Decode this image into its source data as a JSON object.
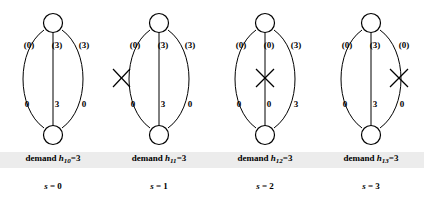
{
  "figure": {
    "type": "diagram",
    "panels": [
      {
        "id": "panel-s0",
        "demand_label": "demand",
        "demand_var": "h",
        "demand_sub": "10",
        "demand_eq": "=3",
        "state_var": "s",
        "state_eq": "= 0",
        "links": [
          {
            "name": "left-arc",
            "capacity_label": "(0)",
            "flow_label": "0",
            "failed": false
          },
          {
            "name": "middle-link",
            "capacity_label": "(3)",
            "flow_label": "3",
            "failed": false
          },
          {
            "name": "right-arc",
            "capacity_label": "(3)",
            "flow_label": "0",
            "failed": false
          }
        ]
      },
      {
        "id": "panel-s1",
        "demand_label": "demand",
        "demand_var": "h",
        "demand_sub": "11",
        "demand_eq": "=3",
        "state_var": "s",
        "state_eq": "= 1",
        "links": [
          {
            "name": "left-arc",
            "capacity_label": "(0)",
            "flow_label": "0",
            "failed": true
          },
          {
            "name": "middle-link",
            "capacity_label": "(3)",
            "flow_label": "3",
            "failed": false
          },
          {
            "name": "right-arc",
            "capacity_label": "(3)",
            "flow_label": "0",
            "failed": false
          }
        ]
      },
      {
        "id": "panel-s2",
        "demand_label": "demand",
        "demand_var": "h",
        "demand_sub": "12",
        "demand_eq": "=3",
        "state_var": "s",
        "state_eq": "= 2",
        "links": [
          {
            "name": "left-arc",
            "capacity_label": "(0)",
            "flow_label": "0",
            "failed": false
          },
          {
            "name": "middle-link",
            "capacity_label": "(0)",
            "flow_label": "0",
            "failed": true
          },
          {
            "name": "right-arc",
            "capacity_label": "(3)",
            "flow_label": "3",
            "failed": false
          }
        ]
      },
      {
        "id": "panel-s3",
        "demand_label": "demand",
        "demand_var": "h",
        "demand_sub": "13",
        "demand_eq": "=3",
        "state_var": "s",
        "state_eq": "= 3",
        "links": [
          {
            "name": "left-arc",
            "capacity_label": "(0)",
            "flow_label": "0",
            "failed": false
          },
          {
            "name": "middle-link",
            "capacity_label": "(3)",
            "flow_label": "3",
            "failed": false
          },
          {
            "name": "right-arc",
            "capacity_label": "(0)",
            "flow_label": "0",
            "failed": true
          }
        ]
      }
    ],
    "colors": {
      "ink": "#000000",
      "node_fill": "#ffffff",
      "caption_highlight": "#ececec"
    }
  }
}
